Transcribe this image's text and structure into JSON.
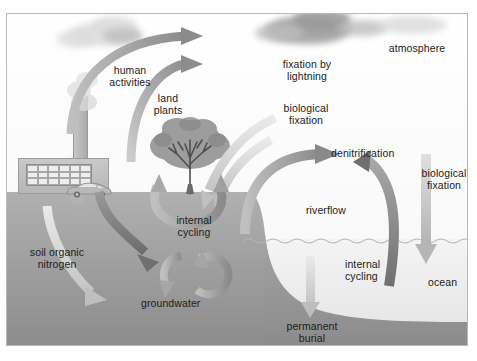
{
  "diagram": {
    "type": "earth-system-cycle",
    "frame": {
      "border_color": "#b9b9b9",
      "background": "#fdfdfd"
    },
    "palette": {
      "sky": "#fdfdfd",
      "land": "#9b9b9b",
      "ocean_water": "#ebebeb",
      "seafloor": "#8f8f8f",
      "arrow_dark": "#7d7d7d",
      "arrow_mid": "#a5a5a5",
      "arrow_light": "#cfcfcf",
      "text": "#1b1b1b",
      "cloud_dark": "#9a9a9a",
      "cloud_light": "#dcdcdc"
    },
    "labels": {
      "human_activities": "human\nactivities",
      "land_plants": "land\nplants",
      "fixation_by_lightning": "fixation by\nlightning",
      "biological_fixation_land": "biological\nfixation",
      "atmosphere": "atmosphere",
      "denitrification": "denitrification",
      "biological_fixation_ocean": "biological\nfixation",
      "riverflow": "riverflow",
      "internal_cycling_land": "internal\ncycling",
      "internal_cycling_ocean": "internal\ncycling",
      "soil_organic_nitrogen": "soil organic\nnitrogen",
      "groundwater": "groundwater",
      "ocean": "ocean",
      "permanent_burial": "permanent\nburial"
    },
    "scene_objects": [
      {
        "name": "factory",
        "label": ""
      },
      {
        "name": "smokestack",
        "label": ""
      },
      {
        "name": "car",
        "label": ""
      },
      {
        "name": "tree",
        "label": ""
      },
      {
        "name": "cloud",
        "label": ""
      },
      {
        "name": "storm-cloud",
        "label": ""
      }
    ],
    "flows": [
      {
        "name": "human-activities-flux",
        "from": "smokestack",
        "to": "atmosphere",
        "direction": "up-right",
        "tone": "mid"
      },
      {
        "name": "land-plants-flux",
        "from": "tree",
        "to": "atmosphere",
        "direction": "up-right",
        "tone": "mid"
      },
      {
        "name": "lightning-fixation-flux",
        "from": "atmosphere",
        "to": "land",
        "direction": "down-left",
        "tone": "light"
      },
      {
        "name": "biological-fixation-land-flux",
        "from": "atmosphere",
        "to": "land",
        "direction": "down-left",
        "tone": "light"
      },
      {
        "name": "denitrification-flux",
        "from": "ocean",
        "to": "atmosphere",
        "direction": "up-left",
        "tone": "mid"
      },
      {
        "name": "biological-fixation-ocean-flux",
        "from": "atmosphere",
        "to": "ocean",
        "direction": "down",
        "tone": "light"
      },
      {
        "name": "ocean-denitrification-flux",
        "from": "ocean",
        "to": "atmosphere",
        "direction": "up",
        "tone": "dark"
      },
      {
        "name": "riverflow-flux",
        "from": "land",
        "to": "ocean",
        "direction": "down-right",
        "tone": "dark"
      },
      {
        "name": "internal-cycling-land-loop",
        "from": "soil",
        "to": "tree",
        "direction": "loop",
        "tone": "mid"
      },
      {
        "name": "internal-cycling-ocean-loop",
        "from": "ocean",
        "to": "ocean",
        "direction": "loop",
        "tone": "mid"
      },
      {
        "name": "groundwater-flux",
        "from": "soil-organic-nitrogen",
        "to": "groundwater",
        "direction": "down-right",
        "tone": "light"
      },
      {
        "name": "permanent-burial-flux",
        "from": "ocean",
        "to": "seafloor",
        "direction": "down",
        "tone": "light"
      }
    ]
  }
}
